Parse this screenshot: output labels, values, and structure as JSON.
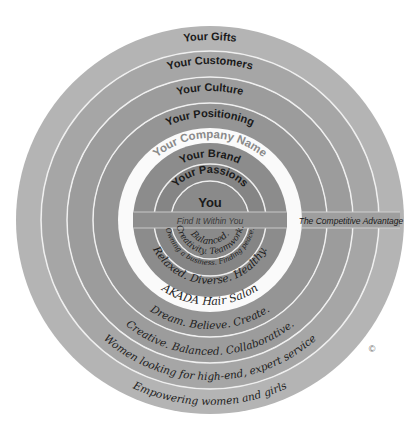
{
  "diagram": {
    "title": "The Competitive Advantage",
    "center": {
      "x": 210,
      "y": 220
    },
    "colors": {
      "background": "#ffffff",
      "ring_divider": "#f2f2f2",
      "band": "#8e8e8e",
      "white_ring": "#fafafa"
    },
    "top_labels": {
      "gifts": "Your Gifts",
      "customers": "Your Customers",
      "culture": "Your Culture",
      "positioning": "Your Positioning",
      "company_name": "Your Company Name",
      "brand": "Your Brand",
      "passions": "Your Passions",
      "you": "You"
    },
    "band": {
      "left_label": "Find It Within You",
      "right_label": "The Competitive Advantage"
    },
    "bottom_answers": {
      "you": "Balanced.",
      "passions_inner": "Creativity. Teamwork.",
      "passions_outer": "Owning a business. Finding peace.",
      "brand": "Relaxed. Diverse. Healthy.",
      "company_name": "AKADA Hair Salon",
      "positioning": "Dream. Believe. Create.",
      "culture": "Creative. Balanced. Collaborative.",
      "customers": "Women looking for high-end, expert service",
      "gifts": "Empowering women and girls"
    },
    "copyright_mark": "©"
  }
}
